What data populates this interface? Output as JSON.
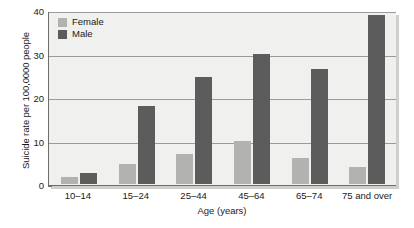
{
  "chart_data": {
    "type": "bar",
    "title": "",
    "subtitle": "",
    "xlabel": "Age (years)",
    "ylabel": "Suicide rate per 100,0000 people",
    "categories": [
      "10–14",
      "15–24",
      "25–44",
      "45–64",
      "65–74",
      "75 and over"
    ],
    "series": [
      {
        "name": "Female",
        "color": "#b2b2b0",
        "values": [
          1.5,
          4.7,
          7.0,
          10.0,
          6.0,
          4.0
        ]
      },
      {
        "name": "Male",
        "color": "#5c5c5c",
        "values": [
          2.5,
          18.0,
          24.5,
          29.8,
          26.5,
          38.8
        ]
      }
    ],
    "ylim": [
      0,
      40
    ],
    "yticks": [
      0,
      10,
      20,
      30,
      40
    ],
    "yticklabels": [
      "0",
      "10",
      "20",
      "30",
      "40"
    ],
    "grid": true,
    "grid_axis": "y",
    "legend_position": "upper left",
    "plot_background": "#f0f0ee",
    "axis_color": "#6d6d6d",
    "grid_color": "#9a9a9a"
  }
}
